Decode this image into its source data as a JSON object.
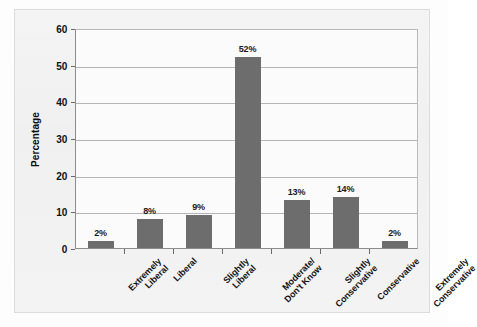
{
  "figure": {
    "background_color": "#f2f2f2",
    "plot_background_color": "#fbfbfb",
    "bar_color": "#6d6d6d",
    "grid_color": "#b5b5b5",
    "axis_color": "#8c8c8c"
  },
  "chart_data": {
    "type": "bar",
    "title": "",
    "xlabel": "",
    "ylabel": "Percentage",
    "ylim": [
      0,
      60
    ],
    "yticks": [
      0,
      10,
      20,
      30,
      40,
      50,
      60
    ],
    "grid": true,
    "legend": "none",
    "value_suffix": "%",
    "categories": [
      "Extremely Liberal",
      "Liberal",
      "Slightly Liberal",
      "Moderate/ Don't Know",
      "Slightly Conservative",
      "Conservative",
      "Extremely Conservative"
    ],
    "category_lines": [
      [
        "Extremely",
        "Liberal"
      ],
      [
        "Liberal"
      ],
      [
        "Slightly",
        "Liberal"
      ],
      [
        "Moderate/",
        "Don't Know"
      ],
      [
        "Slightly",
        "Conservative"
      ],
      [
        "Conservative"
      ],
      [
        "Extremely",
        "Conservative"
      ]
    ],
    "values": [
      2,
      8,
      9,
      52,
      13,
      14,
      2
    ],
    "value_labels": [
      "2%",
      "8%",
      "9%",
      "52%",
      "13%",
      "14%",
      "2%"
    ]
  }
}
